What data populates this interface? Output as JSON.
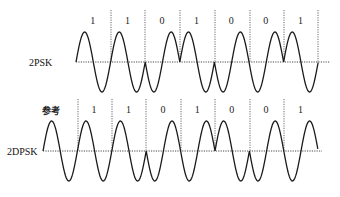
{
  "diagram": {
    "colors": {
      "waveform": "#1a1a1a",
      "axis": "#333333",
      "background": "#ffffff"
    },
    "top": {
      "label": "2PSK",
      "baseline_y": 62,
      "amplitude": 30,
      "start_x": 76,
      "symbol_width": 34.6,
      "bits": [
        "1",
        "1",
        "0",
        "1",
        "0",
        "0",
        "1"
      ],
      "phases": [
        1,
        1,
        -1,
        1,
        -1,
        -1,
        1
      ],
      "boundaries_x": [
        111,
        145,
        180,
        215,
        250,
        284,
        318
      ],
      "axis_x": [
        76,
        330
      ]
    },
    "bottom": {
      "label": "2DPSK",
      "reference_label": "参考",
      "baseline_y": 151,
      "amplitude": 30,
      "start_x": 43,
      "symbol_width": 34.4,
      "bits": [
        "1",
        "1",
        "0",
        "1",
        "0",
        "0",
        "1"
      ],
      "phases": [
        1,
        1,
        1,
        -1,
        -1,
        1,
        -1,
        -1
      ],
      "boundaries_x": [
        78,
        112,
        146,
        181,
        215,
        250,
        284
      ],
      "axis_x": [
        43,
        322
      ]
    }
  }
}
